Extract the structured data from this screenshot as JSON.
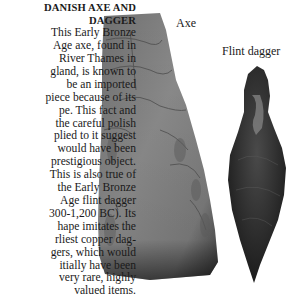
{
  "caption": {
    "heading": [
      "DANISH AXE AND",
      "DAGGER"
    ],
    "lines": [
      "This Early Bronze",
      "Age axe, found in",
      "River Thames in",
      "gland, is known to",
      "be an imported",
      "piece because of its",
      "pe. This fact and",
      "the careful polish",
      "plied to it suggest",
      "would have been",
      "prestigious object.",
      "This is also true of",
      "the Early Bronze",
      "Age flint dagger",
      "300-1,200 BC). Its",
      "hape imitates the",
      "rliest copper dag-",
      "gers, which would",
      "itially have been",
      "very rare, highly",
      "valued items."
    ]
  },
  "labels": {
    "axe": "Axe",
    "dagger": "Flint dagger"
  },
  "images": {
    "axe": "stone-axe-photo",
    "dagger": "flint-dagger-photo"
  }
}
